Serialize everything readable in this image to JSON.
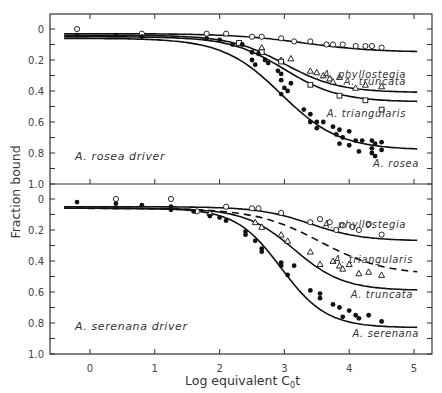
{
  "chart_data": [
    {
      "type": "scatter",
      "panel": "top",
      "title": "A. rosea driver",
      "xlabel": "Log equivalent C0t",
      "ylabel": "Fraction bound",
      "xlim": [
        -0.6,
        5.3
      ],
      "ylim": [
        1.0,
        0
      ],
      "x_ticks": [
        0,
        1,
        2,
        3,
        4,
        5
      ],
      "y_ticks": [
        0,
        0.2,
        0.4,
        0.6,
        0.8,
        1.0
      ],
      "grid": false,
      "legend": "inline labels at right end of curves",
      "series": [
        {
          "name": "A. phyllostegia",
          "marker": "open-circle",
          "curve": {
            "start": 0.03,
            "end": 0.15,
            "mid": 3.3,
            "width": 0.55,
            "dash": false
          },
          "points": [
            [
              -0.2,
              0.0
            ],
            [
              0.8,
              0.03
            ],
            [
              1.8,
              0.03
            ],
            [
              2.1,
              0.03
            ],
            [
              2.5,
              0.05
            ],
            [
              2.65,
              0.05
            ],
            [
              2.95,
              0.06
            ],
            [
              3.15,
              0.08
            ],
            [
              3.4,
              0.08
            ],
            [
              3.65,
              0.1
            ],
            [
              3.75,
              0.1
            ],
            [
              3.9,
              0.1
            ],
            [
              4.1,
              0.11
            ],
            [
              4.25,
              0.11
            ],
            [
              4.35,
              0.11
            ],
            [
              4.5,
              0.12
            ]
          ]
        },
        {
          "name": "A. truncata",
          "marker": "open-triangle",
          "curve": {
            "start": 0.04,
            "end": 0.41,
            "mid": 3.0,
            "width": 0.42,
            "dash": false
          },
          "points": [
            [
              2.65,
              0.12
            ],
            [
              2.95,
              0.2
            ],
            [
              3.1,
              0.19
            ],
            [
              3.4,
              0.27
            ],
            [
              3.5,
              0.28
            ],
            [
              3.6,
              0.3
            ],
            [
              3.7,
              0.32
            ],
            [
              3.75,
              0.34
            ],
            [
              3.85,
              0.31
            ],
            [
              4.1,
              0.38
            ],
            [
              4.25,
              0.36
            ],
            [
              4.5,
              0.37
            ]
          ]
        },
        {
          "name": "A. triangularis",
          "marker": "open-square",
          "curve": {
            "start": 0.05,
            "end": 0.47,
            "mid": 3.0,
            "width": 0.42,
            "dash": false
          },
          "points": [
            [
              2.3,
              0.09
            ],
            [
              2.65,
              0.15
            ],
            [
              2.95,
              0.21
            ],
            [
              3.4,
              0.36
            ],
            [
              3.85,
              0.43
            ],
            [
              4.25,
              0.46
            ],
            [
              4.5,
              0.52
            ]
          ]
        },
        {
          "name": "A. rosea",
          "marker": "filled-circle",
          "curve": {
            "start": 0.06,
            "end": 0.78,
            "mid": 2.95,
            "width": 0.45,
            "dash": false
          },
          "points": [
            [
              -0.2,
              0.04
            ],
            [
              0.4,
              0.04
            ],
            [
              0.8,
              0.05
            ],
            [
              1.8,
              0.06
            ],
            [
              2.0,
              0.07
            ],
            [
              2.2,
              0.1
            ],
            [
              2.35,
              0.1
            ],
            [
              2.5,
              0.15
            ],
            [
              2.6,
              0.16
            ],
            [
              2.5,
              0.2
            ],
            [
              2.55,
              0.23
            ],
            [
              2.7,
              0.2
            ],
            [
              2.75,
              0.22
            ],
            [
              2.9,
              0.27
            ],
            [
              2.95,
              0.29
            ],
            [
              2.95,
              0.33
            ],
            [
              3.1,
              0.35
            ],
            [
              3.0,
              0.38
            ],
            [
              2.95,
              0.42
            ],
            [
              3.05,
              0.4
            ],
            [
              3.3,
              0.52
            ],
            [
              3.4,
              0.55
            ],
            [
              3.5,
              0.6
            ],
            [
              3.6,
              0.6
            ],
            [
              3.75,
              0.63
            ],
            [
              3.85,
              0.65
            ],
            [
              3.9,
              0.7
            ],
            [
              4.0,
              0.66
            ],
            [
              4.1,
              0.72
            ],
            [
              4.2,
              0.72
            ],
            [
              4.35,
              0.72
            ],
            [
              4.35,
              0.77
            ],
            [
              4.4,
              0.74
            ],
            [
              4.5,
              0.73
            ],
            [
              3.4,
              0.6
            ],
            [
              3.5,
              0.64
            ],
            [
              3.8,
              0.68
            ],
            [
              3.85,
              0.74
            ],
            [
              4.0,
              0.75
            ],
            [
              4.15,
              0.79
            ],
            [
              4.35,
              0.8
            ],
            [
              4.4,
              0.82
            ],
            [
              4.5,
              0.78
            ]
          ]
        }
      ]
    },
    {
      "type": "scatter",
      "panel": "bottom",
      "title": "A. serenana driver",
      "xlabel": "Log equivalent C0t",
      "ylabel": "Fraction bound",
      "xlim": [
        -0.6,
        5.3
      ],
      "ylim": [
        1.0,
        0
      ],
      "x_ticks": [
        0,
        1,
        2,
        3,
        4,
        5
      ],
      "y_ticks": [
        0,
        0.2,
        0.4,
        0.6,
        0.8,
        1.0
      ],
      "grid": false,
      "legend": "inline labels at right end of curves",
      "series": [
        {
          "name": "A. phyllostegia",
          "marker": "open-circle",
          "curve": {
            "start": 0.05,
            "end": 0.27,
            "mid": 3.4,
            "width": 0.4,
            "dash": false
          },
          "points": [
            [
              0.4,
              0.0
            ],
            [
              1.25,
              0.0
            ],
            [
              1.65,
              0.08
            ],
            [
              2.1,
              0.05
            ],
            [
              2.5,
              0.06
            ],
            [
              2.6,
              0.06
            ],
            [
              2.95,
              0.09
            ],
            [
              3.4,
              0.15
            ],
            [
              3.55,
              0.13
            ],
            [
              3.7,
              0.15
            ],
            [
              3.8,
              0.2
            ],
            [
              3.9,
              0.17
            ],
            [
              4.05,
              0.18
            ],
            [
              4.15,
              0.2
            ],
            [
              4.3,
              0.16
            ],
            [
              4.5,
              0.23
            ]
          ]
        },
        {
          "name": "A. triangularis",
          "marker": "none",
          "curve": {
            "start": 0.06,
            "end": 0.49,
            "mid": 3.55,
            "width": 0.5,
            "dash": true
          },
          "points": []
        },
        {
          "name": "A. truncata",
          "marker": "open-triangle",
          "curve": {
            "start": 0.06,
            "end": 0.59,
            "mid": 3.15,
            "width": 0.38,
            "dash": false
          },
          "points": [
            [
              1.85,
              0.09
            ],
            [
              2.55,
              0.15
            ],
            [
              2.65,
              0.18
            ],
            [
              2.95,
              0.23
            ],
            [
              3.05,
              0.27
            ],
            [
              3.4,
              0.34
            ],
            [
              3.55,
              0.42
            ],
            [
              3.75,
              0.4
            ],
            [
              3.85,
              0.43
            ],
            [
              3.9,
              0.45
            ],
            [
              4.0,
              0.42
            ],
            [
              4.15,
              0.48
            ],
            [
              4.3,
              0.47
            ],
            [
              4.5,
              0.49
            ]
          ]
        },
        {
          "name": "A. serenana",
          "marker": "filled-circle",
          "curve": {
            "start": 0.06,
            "end": 0.83,
            "mid": 2.95,
            "width": 0.35,
            "dash": false
          },
          "points": [
            [
              -0.2,
              0.02
            ],
            [
              0.4,
              0.03
            ],
            [
              0.8,
              0.04
            ],
            [
              1.25,
              0.05
            ],
            [
              1.25,
              0.07
            ],
            [
              1.6,
              0.08
            ],
            [
              1.85,
              0.11
            ],
            [
              2.0,
              0.12
            ],
            [
              2.1,
              0.14
            ],
            [
              2.4,
              0.21
            ],
            [
              2.4,
              0.23
            ],
            [
              2.55,
              0.27
            ],
            [
              2.65,
              0.32
            ],
            [
              2.65,
              0.34
            ],
            [
              2.95,
              0.41
            ],
            [
              2.95,
              0.43
            ],
            [
              3.15,
              0.43
            ],
            [
              3.05,
              0.49
            ],
            [
              3.4,
              0.59
            ],
            [
              3.55,
              0.61
            ],
            [
              3.55,
              0.64
            ],
            [
              3.75,
              0.68
            ],
            [
              3.85,
              0.7
            ],
            [
              3.9,
              0.76
            ],
            [
              4.0,
              0.72
            ],
            [
              4.1,
              0.75
            ],
            [
              4.15,
              0.77
            ],
            [
              4.3,
              0.75
            ],
            [
              4.5,
              0.79
            ]
          ]
        }
      ]
    }
  ],
  "axes": {
    "y_title": "Fraction bound",
    "x_title_main": "Log equivalent C",
    "x_title_sub": "0",
    "x_title_end": "t",
    "x_tick_labels": [
      "0",
      "1",
      "2",
      "3",
      "4",
      "5"
    ],
    "y_tick_labels": [
      "0",
      "0.2",
      "0.4",
      "0.6",
      "0.8",
      "1.0"
    ]
  },
  "labels": {
    "top_driver": "A. rosea driver",
    "bottom_driver": "A. serenana driver"
  },
  "colors": {
    "ink": "#111111",
    "frame": "#333333",
    "text": "#333333",
    "background": "#ffffff"
  }
}
